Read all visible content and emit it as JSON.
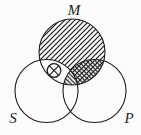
{
  "diagram": {
    "type": "venn-diagram-3-circles-syllogism",
    "labels": {
      "top_circle": "M",
      "bottom_left_circle": "S",
      "bottom_right_circle": "P"
    },
    "x_mark": {
      "symbol": "⊗",
      "region": "S-and-M-only"
    },
    "shading": {
      "m_only": "diagonal-hatch-forward-slash",
      "m_and_p_only": "cross-hatch",
      "m_and_s_and_p": "diagonal-hatch-back-slash",
      "m_and_s_only": "unshaded-with-circled-x"
    },
    "colors": {
      "line": "#1e1e1e",
      "background": "#fbfbfb"
    }
  }
}
